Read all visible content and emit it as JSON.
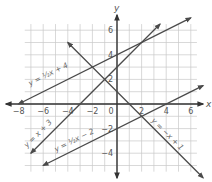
{
  "chart_data": {
    "type": "line",
    "title": "",
    "xlabel": "x",
    "ylabel": "y",
    "xlim": [
      -8,
      7
    ],
    "ylim": [
      -6,
      7
    ],
    "grid": true,
    "x_ticks": [
      -8,
      -6,
      -4,
      -2,
      0,
      2,
      4,
      6
    ],
    "y_ticks": [
      6,
      4,
      2,
      -2,
      -4
    ],
    "x_tick_labels": [
      "−8",
      "−6",
      "−4",
      "−2",
      "0",
      "2",
      "4",
      "6"
    ],
    "y_tick_labels": [
      "6",
      "4",
      "2",
      "−2",
      "−4"
    ],
    "series": [
      {
        "name": "y = ½x + 4",
        "slope": 0.5,
        "intercept": 4,
        "x": [
          -8,
          6
        ],
        "y": [
          0,
          7
        ]
      },
      {
        "name": "y = x + 3",
        "slope": 1,
        "intercept": 3,
        "x": [
          -7,
          3.5
        ],
        "y": [
          -4,
          6.5
        ]
      },
      {
        "name": "y = ½x − 2",
        "slope": 0.5,
        "intercept": -2,
        "x": [
          -6,
          7
        ],
        "y": [
          -5,
          1.5
        ]
      },
      {
        "name": "y = −x + 1",
        "slope": -1,
        "intercept": 1,
        "x": [
          -4,
          7
        ],
        "y": [
          5,
          -6
        ]
      }
    ],
    "labels": {
      "eq1": "y = ½x + 4",
      "eq2": "y = x + 3",
      "eq3": "y = ½x − 2",
      "eq4": "y = −x + 1"
    }
  },
  "colors": {
    "line": "#4a4a4a",
    "grid": "#c8c8c8",
    "axis": "#333333"
  }
}
